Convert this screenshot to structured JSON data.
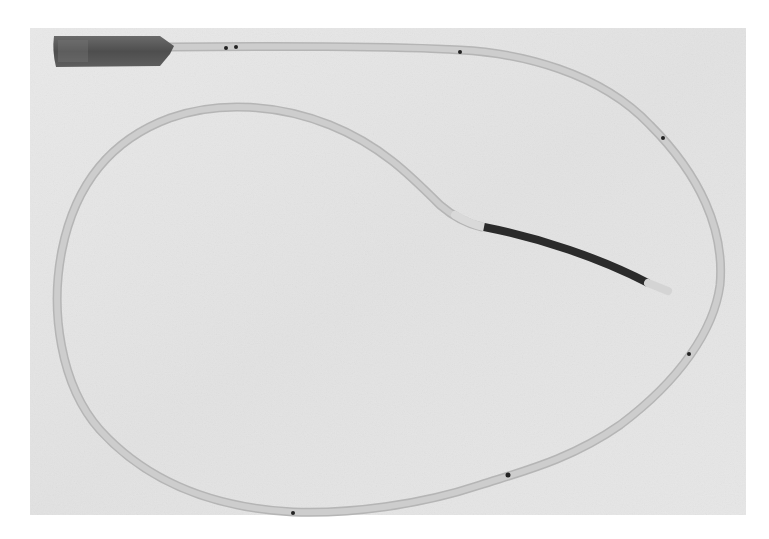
{
  "image": {
    "subject": "catheter with connector hub, looped tube and dark distal segment",
    "tone": "grayscale photograph",
    "colors": {
      "page_background": "#ffffff",
      "photo_background": "#e6e6e6",
      "tube": "#c9c9c9",
      "tube_edge": "#b8b8b8",
      "hub": "#5a5a5a",
      "dark_segment": "#2a2a2a",
      "tip": "#d6d6d6",
      "marker_dot": "#222222"
    },
    "marker_dot_count": 7
  }
}
